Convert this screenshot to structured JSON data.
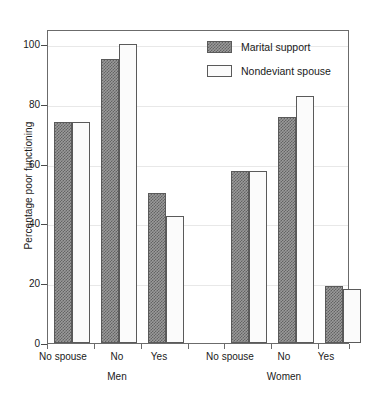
{
  "chart_data": {
    "type": "bar",
    "title": "",
    "xlabel": "",
    "ylabel": "Percentage poor functioning",
    "ylim": [
      0,
      105
    ],
    "yticks": [
      0,
      20,
      40,
      60,
      80,
      100
    ],
    "ytick_labels": [
      "0",
      "20",
      "40",
      "60",
      "80",
      "100"
    ],
    "grid": true,
    "grid_axis": "y",
    "legend_position": "upper right",
    "groups": [
      {
        "name": "Men",
        "categories": [
          "No spouse",
          "No",
          "Yes"
        ]
      },
      {
        "name": "Women",
        "categories": [
          "No spouse",
          "No",
          "Yes"
        ]
      }
    ],
    "categories": [
      "Men / No spouse",
      "Men / No",
      "Men / Yes",
      "Women / No spouse",
      "Women / No",
      "Women / Yes"
    ],
    "series": [
      {
        "name": "Marital support",
        "fill": "hatched",
        "color": "#8f8f8f",
        "values": [
          74,
          95,
          50,
          57.5,
          75.5,
          19
        ]
      },
      {
        "name": "Nondeviant spouse",
        "fill": "open",
        "color": "#fbfbfb",
        "values": [
          74,
          100,
          42.5,
          57.5,
          82.5,
          18
        ]
      }
    ]
  },
  "axis": {
    "y_title": "Percentage poor functioning",
    "y_tick_0": "0",
    "y_tick_20": "20",
    "y_tick_40": "40",
    "y_tick_60": "60",
    "y_tick_80": "80",
    "y_tick_100": "100"
  },
  "legend": {
    "entries": [
      {
        "label": "Marital support",
        "style": "hatched"
      },
      {
        "label": "Nondeviant spouse",
        "style": "open"
      }
    ]
  },
  "x_labels": {
    "men_no_spouse": "No spouse",
    "men_no": "No",
    "men_yes": "Yes",
    "women_no_spouse": "No spouse",
    "women_no": "No",
    "women_yes": "Yes",
    "group_men": "Men",
    "group_women": "Women"
  },
  "colors": {
    "frame": "#6b6b6b",
    "grid": "#e8e8e8",
    "hatch": "#636363",
    "open_fill": "#fbfbfb",
    "text": "#1a1a1a"
  }
}
